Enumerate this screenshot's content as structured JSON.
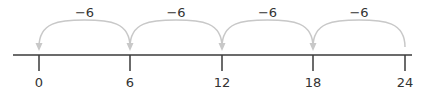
{
  "number_line": {
    "axis": {
      "x_start": 13,
      "x_end": 412,
      "y": 55,
      "color": "#3a3a3a"
    },
    "ticks": [
      {
        "value": "0",
        "x": 39
      },
      {
        "value": "6",
        "x": 130
      },
      {
        "value": "12",
        "x": 222
      },
      {
        "value": "18",
        "x": 313
      },
      {
        "value": "24",
        "x": 405
      }
    ],
    "jumps": [
      {
        "label": "−6",
        "from_x": 130,
        "to_x": 39
      },
      {
        "label": "−6",
        "from_x": 222,
        "to_x": 130
      },
      {
        "label": "−6",
        "from_x": 313,
        "to_x": 222
      },
      {
        "label": "−6",
        "from_x": 405,
        "to_x": 313
      }
    ],
    "arc_color": "#c8c8c8",
    "text_color": "#333333"
  }
}
